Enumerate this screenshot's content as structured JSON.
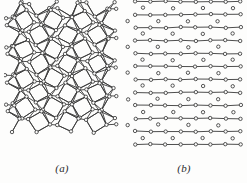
{
  "figure": {
    "background_color": "#fdfdfc",
    "line_color": "#3a3a3a",
    "node_fill_color": "#fbfbfa",
    "node_stroke_color": "#2e2e2e",
    "width": 247,
    "height": 183
  },
  "panels": [
    {
      "id": "a",
      "caption": "(a)",
      "lattice_name": "snub-square-tiling",
      "vertex_configuration": "3.3.4.3.4",
      "description": "Square-triangle (snub square) network of bonded atoms with small open-circle vertices",
      "region": {
        "x": 4,
        "y": 4,
        "width": 112,
        "height": 152
      },
      "columns": 6,
      "rows": 8
    },
    {
      "id": "b",
      "caption": "(b)",
      "lattice_name": "kagome-tiling",
      "vertex_configuration": "3.6.3.6",
      "description": "Hexagon-triangle (kagome) network of bonded atoms with small open-circle vertices",
      "region": {
        "x": 124,
        "y": 4,
        "width": 116,
        "height": 152
      },
      "columns": 4,
      "rows": 5
    }
  ],
  "chart_data": {
    "type": "diagram",
    "title": "",
    "subtitle": "",
    "panels": [
      "(a)",
      "(b)"
    ],
    "annotations": [
      "(a)",
      "(b)"
    ],
    "legend": [],
    "xlabel": "",
    "ylabel": ""
  }
}
